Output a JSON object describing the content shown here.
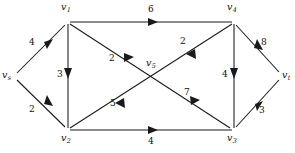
{
  "figure": {
    "type": "directed-flow-network-diagram",
    "background_color": "#ffffff",
    "stroke_color": "#1a1a1a",
    "width": 295,
    "height": 153
  },
  "nodes": [
    {
      "id": "vs",
      "label": "v",
      "sub": "s",
      "x": 14,
      "y": 76,
      "label_x": 2,
      "label_y": 70
    },
    {
      "id": "v1",
      "label": "v",
      "sub": "1",
      "x": 68,
      "y": 22,
      "label_x": 61,
      "label_y": 2
    },
    {
      "id": "v2",
      "label": "v",
      "sub": "2",
      "x": 68,
      "y": 130,
      "label_x": 61,
      "label_y": 133
    },
    {
      "id": "v5",
      "label": "v",
      "sub": "5",
      "x": 152,
      "y": 76,
      "label_x": 146,
      "label_y": 58
    },
    {
      "id": "v4",
      "label": "v",
      "sub": "4",
      "x": 234,
      "y": 22,
      "label_x": 227,
      "label_y": 2
    },
    {
      "id": "v3",
      "label": "v",
      "sub": "3",
      "x": 234,
      "y": 130,
      "label_x": 227,
      "label_y": 133
    },
    {
      "id": "vt",
      "label": "v",
      "sub": "t",
      "x": 281,
      "y": 76,
      "label_x": 282,
      "label_y": 70
    }
  ],
  "edges": [
    {
      "id": "vs-v1",
      "from": "vs",
      "to": "v1",
      "capacity": "4",
      "label_x": 29,
      "label_y": 38
    },
    {
      "id": "vs-v2",
      "from": "vs",
      "to": "v2",
      "capacity": "2",
      "label_x": 29,
      "label_y": 105
    },
    {
      "id": "v1-v4",
      "from": "v1",
      "to": "v4",
      "capacity": "6",
      "label_x": 148,
      "label_y": 5
    },
    {
      "id": "v1-v2",
      "from": "v1",
      "to": "v2",
      "capacity": "3",
      "label_x": 57,
      "label_y": 70
    },
    {
      "id": "v1-v5",
      "from": "v1",
      "to": "v5",
      "capacity": "2",
      "label_x": 109,
      "label_y": 54
    },
    {
      "id": "v2-v5",
      "from": "v2",
      "to": "v5",
      "capacity": "5",
      "label_x": 110,
      "label_y": 99
    },
    {
      "id": "v2-v3",
      "from": "v2",
      "to": "v3",
      "capacity": "4",
      "label_x": 148,
      "label_y": 137
    },
    {
      "id": "v5-v4",
      "from": "v5",
      "to": "v4",
      "capacity": "2",
      "label_x": 180,
      "label_y": 37
    },
    {
      "id": "v5-v3",
      "from": "v5",
      "to": "v3",
      "capacity": "7",
      "label_x": 184,
      "label_y": 88
    },
    {
      "id": "v4-v3",
      "from": "v4",
      "to": "v3",
      "capacity": "4",
      "label_x": 222,
      "label_y": 70
    },
    {
      "id": "v4-vt",
      "from": "v4",
      "to": "vt",
      "capacity": "8",
      "label_x": 261,
      "label_y": 38
    },
    {
      "id": "v3-vt",
      "from": "v3",
      "to": "vt",
      "capacity": "3",
      "label_x": 259,
      "label_y": 106
    }
  ]
}
